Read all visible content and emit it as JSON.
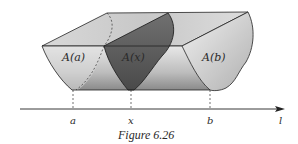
{
  "figure": {
    "caption": "Figure 6.26",
    "cross_sections": [
      {
        "label": "A(a)",
        "position": "a"
      },
      {
        "label": "A(x)",
        "position": "x"
      },
      {
        "label": "A(b)",
        "position": "b"
      }
    ],
    "axis": {
      "name": "l",
      "ticks": [
        "a",
        "x",
        "b"
      ]
    },
    "colors": {
      "solid_light": "#e6e6e6",
      "solid_mid": "#c4c4c4",
      "solid_dark": "#8c8c8c",
      "highlighted_slice": "#5e5e5e",
      "edge": "#222222"
    }
  }
}
